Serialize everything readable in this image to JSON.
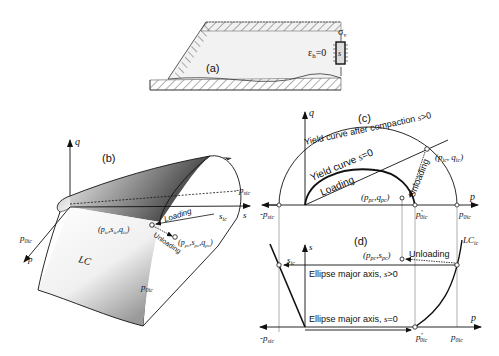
{
  "panels": {
    "a": {
      "label": "(a)",
      "strain_label": "ε",
      "strain_sub": "h",
      "strain_eq": "=0",
      "stress_label": "σ",
      "stress_sub": "v",
      "suction_label": "s"
    },
    "b": {
      "label": "(b)",
      "axis_q": "q",
      "axis_s": "s",
      "axis_p": "p",
      "neg_psic": "-p",
      "neg_psic_sub": "sic",
      "s_ic": "s",
      "s_ic_sub": "ic",
      "p0ic_star": "p",
      "p0ic_star_sub": "0ic",
      "p0ic_star_sup": "*",
      "p0ic": "p",
      "p0ic_sub": "0ic",
      "lc_label": "LC",
      "loading_label": "Loading",
      "unloading_label": "Unloading",
      "point_ic": "(p",
      "point_ic_full": "(p_ic, s_ic, q_ic)",
      "point_pc_full": "(p_pc, s_pc, q_pc)"
    },
    "c": {
      "label": "(c)",
      "axis_q": "q",
      "axis_p": "p",
      "yield_after": "Yield curve after compaction s>0",
      "yield_s0": "Yield curve s=0",
      "loading_label": "Loading",
      "unloading_label": "Unloading",
      "point_ic": "(p_ic, q_ic)",
      "point_pc": "(p_pc, q_pc)",
      "neg_psic": "-p_sic",
      "p0ic_star": "p*_0ic",
      "p0ic": "p_0ic"
    },
    "d": {
      "label": "(d)",
      "axis_s": "s",
      "axis_p": "p",
      "lc_label": "LC_ic",
      "s_ic": "s_ic",
      "unloading_label": "Unloading",
      "point_pc": "(p_pc, s_pc)",
      "major_axis_pos": "Ellipse major axis, s>0",
      "major_axis_zero": "Ellipse major axis, s=0",
      "neg_psic": "-p_sic",
      "p0ic_star": "p*_0ic",
      "p0ic": "p_0ic"
    }
  },
  "colors": {
    "ink": "#1a1a1a",
    "guide": "#9a9a9a",
    "soil_fill": "#f3f3f3",
    "surface_dark": "#2a2a2a",
    "surface_light": "#ffffff"
  }
}
